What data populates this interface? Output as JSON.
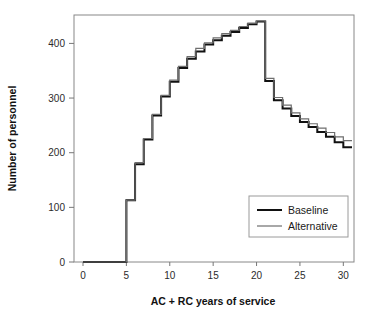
{
  "figure": {
    "background": "#ffffff",
    "frame_color": "#888888",
    "clipped_title": ""
  },
  "chart_data": {
    "type": "line",
    "subtype": "step",
    "title": "",
    "xlabel": "AC + RC years of service",
    "ylabel": "Number of personnel",
    "xlim": [
      0,
      31
    ],
    "ylim": [
      0,
      452
    ],
    "xticks": [
      0,
      5,
      10,
      15,
      20,
      25,
      30
    ],
    "xticklabels": [
      "0",
      "5",
      "10",
      "15",
      "20",
      "25",
      "30"
    ],
    "yticks": [
      0,
      100,
      200,
      300,
      400
    ],
    "yticklabels": [
      "0",
      "100",
      "200",
      "300",
      "400"
    ],
    "grid": false,
    "legend_position": "lower right",
    "x": [
      0,
      1,
      2,
      3,
      4,
      5,
      6,
      7,
      8,
      9,
      10,
      11,
      12,
      13,
      14,
      15,
      16,
      17,
      18,
      19,
      20,
      21,
      22,
      23,
      24,
      25,
      26,
      27,
      28,
      29,
      30
    ],
    "series": [
      {
        "name": "Baseline",
        "color": "#111111",
        "linewidth": 2.0,
        "values": [
          0,
          0,
          0,
          0,
          0,
          113,
          179,
          224,
          268,
          303,
          330,
          355,
          372,
          385,
          398,
          406,
          414,
          421,
          428,
          435,
          440,
          331,
          296,
          281,
          267,
          256,
          247,
          238,
          229,
          219,
          210
        ]
      },
      {
        "name": "Alternative",
        "color": "#6e6e6e",
        "linewidth": 1.2,
        "values": [
          0,
          0,
          0,
          0,
          0,
          113,
          182,
          226,
          270,
          305,
          333,
          358,
          376,
          391,
          401,
          410,
          418,
          424,
          431,
          437,
          441,
          336,
          301,
          287,
          273,
          262,
          253,
          245,
          237,
          229,
          222
        ]
      }
    ]
  },
  "legend": {
    "entries": [
      {
        "label": "Baseline"
      },
      {
        "label": "Alternative"
      }
    ]
  }
}
